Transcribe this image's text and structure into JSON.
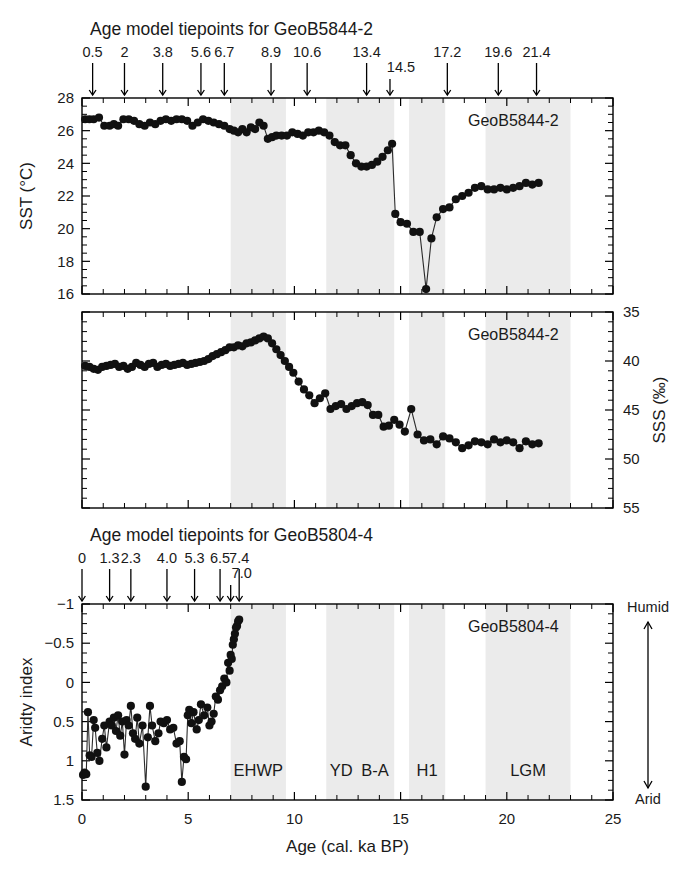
{
  "figure": {
    "xaxis": {
      "label": "Age (cal. ka BP)",
      "min": 0,
      "max": 25,
      "ticks": [
        0,
        5,
        10,
        15,
        20,
        25
      ],
      "tick_labels": [
        "0",
        "5",
        "10",
        "15",
        "20",
        "25"
      ],
      "minor_step": 1
    },
    "bands": [
      {
        "name": "EHWP",
        "start": 7.0,
        "end": 9.6,
        "label": "EHWP"
      },
      {
        "name": "YD",
        "start": 11.5,
        "end": 12.9,
        "label": "YD"
      },
      {
        "name": "B-A",
        "start": 12.9,
        "end": 14.7,
        "label": "B-A"
      },
      {
        "name": "H1",
        "start": 15.4,
        "end": 17.1,
        "label": "H1"
      },
      {
        "name": "LGM",
        "start": 19.0,
        "end": 23.0,
        "label": "LGM"
      }
    ],
    "humid_arrow": {
      "top_label": "Humid",
      "bottom_label": "Arid"
    }
  },
  "tiepoints_top": {
    "title": "Age model tiepoints for GeoB5844-2",
    "values": [
      "0.5",
      "2",
      "3.8",
      "5.6",
      "6.7",
      "8.9",
      "10.6",
      "13.4",
      "14.5",
      "17.2",
      "19.6",
      "21.4"
    ],
    "positions": [
      0.5,
      2.0,
      3.8,
      5.6,
      6.7,
      8.9,
      10.6,
      13.4,
      14.5,
      17.2,
      19.6,
      21.4
    ],
    "offset_label_index": 8
  },
  "tiepoints_bottom": {
    "title": "Age model tiepoints for GeoB5804-4",
    "values": [
      "0",
      "1.3",
      "2.3",
      "4.0",
      "5.3",
      "6.5",
      "7.0",
      "7.4"
    ],
    "positions": [
      0.0,
      1.3,
      2.3,
      4.0,
      5.3,
      6.5,
      7.0,
      7.4
    ],
    "offset_label_index": 6
  },
  "chart_data": [
    {
      "type": "line",
      "id": "sst",
      "core_label": "GeoB5844-2",
      "ylabel": "SST (°C)",
      "ylim": [
        16,
        28
      ],
      "y_inverted": false,
      "yticks": [
        16,
        18,
        20,
        22,
        24,
        26,
        28
      ],
      "ytick_labels": [
        "16",
        "18",
        "20",
        "22",
        "24",
        "26",
        "28"
      ],
      "yminor_step": 0.5,
      "xlabel": "",
      "x": [
        0.15,
        0.35,
        0.55,
        0.8,
        1.05,
        1.3,
        1.5,
        1.7,
        1.95,
        2.2,
        2.45,
        2.7,
        2.95,
        3.2,
        3.45,
        3.7,
        3.95,
        4.2,
        4.45,
        4.7,
        4.95,
        5.2,
        5.45,
        5.7,
        5.95,
        6.2,
        6.45,
        6.7,
        6.95,
        7.15,
        7.35,
        7.55,
        7.75,
        7.95,
        8.15,
        8.35,
        8.55,
        8.75,
        8.95,
        9.15,
        9.4,
        9.65,
        9.9,
        10.15,
        10.4,
        10.65,
        10.9,
        11.15,
        11.4,
        11.65,
        11.9,
        12.15,
        12.4,
        12.65,
        12.9,
        13.15,
        13.4,
        13.65,
        13.9,
        14.15,
        14.4,
        14.6,
        14.75,
        15.0,
        15.3,
        15.6,
        15.9,
        16.2,
        16.45,
        16.7,
        17.0,
        17.3,
        17.6,
        17.9,
        18.2,
        18.5,
        18.8,
        19.1,
        19.4,
        19.7,
        20.0,
        20.3,
        20.6,
        20.9,
        21.2,
        21.5
      ],
      "y": [
        26.7,
        26.7,
        26.7,
        26.8,
        26.3,
        26.3,
        26.4,
        26.3,
        26.7,
        26.7,
        26.6,
        26.4,
        26.3,
        26.5,
        26.4,
        26.6,
        26.7,
        26.6,
        26.7,
        26.7,
        26.6,
        26.3,
        26.5,
        26.7,
        26.6,
        26.5,
        26.4,
        26.3,
        26.1,
        26.0,
        25.9,
        26.1,
        25.9,
        26.2,
        26.1,
        26.5,
        26.3,
        25.5,
        25.6,
        25.7,
        25.7,
        25.7,
        25.9,
        25.8,
        25.7,
        25.9,
        25.9,
        26.0,
        25.9,
        25.7,
        25.3,
        25.1,
        25.1,
        24.5,
        24.0,
        23.8,
        23.8,
        23.9,
        24.1,
        24.4,
        24.8,
        25.2,
        20.9,
        20.4,
        20.3,
        19.8,
        19.8,
        16.3,
        19.4,
        20.7,
        21.2,
        21.3,
        21.8,
        22.0,
        22.2,
        22.5,
        22.6,
        22.4,
        22.4,
        22.5,
        22.4,
        22.5,
        22.6,
        22.8,
        22.7,
        22.8
      ]
    },
    {
      "type": "line",
      "id": "sss",
      "core_label": "GeoB5844-2",
      "ylabel": "SSS (‰)",
      "ylim": [
        35,
        55
      ],
      "y_inverted": true,
      "yticks": [
        35,
        40,
        45,
        50,
        55
      ],
      "ytick_labels": [
        "35",
        "40",
        "45",
        "50",
        "55"
      ],
      "yminor_step": 1,
      "xlabel": "",
      "x": [
        0.15,
        0.35,
        0.55,
        0.75,
        0.95,
        1.15,
        1.35,
        1.55,
        1.75,
        1.95,
        2.15,
        2.35,
        2.55,
        2.75,
        2.95,
        3.15,
        3.35,
        3.55,
        3.75,
        3.95,
        4.15,
        4.35,
        4.55,
        4.75,
        4.95,
        5.15,
        5.35,
        5.55,
        5.75,
        5.95,
        6.15,
        6.35,
        6.55,
        6.75,
        6.95,
        7.15,
        7.35,
        7.55,
        7.75,
        7.95,
        8.15,
        8.35,
        8.55,
        8.75,
        8.95,
        9.15,
        9.35,
        9.55,
        9.75,
        9.95,
        10.2,
        10.45,
        10.7,
        10.95,
        11.2,
        11.45,
        11.7,
        11.95,
        12.2,
        12.45,
        12.7,
        12.95,
        13.2,
        13.45,
        13.7,
        13.95,
        14.2,
        14.45,
        14.7,
        14.95,
        15.2,
        15.5,
        15.8,
        16.1,
        16.4,
        16.7,
        17.0,
        17.3,
        17.6,
        17.9,
        18.2,
        18.5,
        18.8,
        19.1,
        19.4,
        19.7,
        20.0,
        20.3,
        20.6,
        20.9,
        21.2,
        21.5
      ],
      "y": [
        40.5,
        40.6,
        40.8,
        40.9,
        40.6,
        40.5,
        40.4,
        40.3,
        40.6,
        40.5,
        40.8,
        40.6,
        40.2,
        40.4,
        40.6,
        40.3,
        40.2,
        40.6,
        40.4,
        40.3,
        40.5,
        40.4,
        40.3,
        40.2,
        40.4,
        40.3,
        40.2,
        40.1,
        40.0,
        39.8,
        39.5,
        39.3,
        39.1,
        38.9,
        38.6,
        38.6,
        38.4,
        38.5,
        38.2,
        38.1,
        37.9,
        37.7,
        37.5,
        37.7,
        38.2,
        38.8,
        39.4,
        40.0,
        40.6,
        41.2,
        42.1,
        42.9,
        43.5,
        44.3,
        43.8,
        43.3,
        44.9,
        44.6,
        44.4,
        44.9,
        44.6,
        44.3,
        44.2,
        44.5,
        45.5,
        45.5,
        46.7,
        46.6,
        46.0,
        46.5,
        47.2,
        44.9,
        47.5,
        48.1,
        48.0,
        48.5,
        47.7,
        47.9,
        48.3,
        48.9,
        48.6,
        48.2,
        48.3,
        48.5,
        48.0,
        48.3,
        48.1,
        48.3,
        48.9,
        48.2,
        48.5,
        48.4
      ]
    },
    {
      "type": "line",
      "id": "aridity",
      "core_label": "GeoB5804-4",
      "ylabel": "Aridty index",
      "ylim": [
        -1,
        1.5
      ],
      "y_inverted": true,
      "yticks": [
        -1,
        -0.5,
        0,
        0.5,
        1,
        1.5
      ],
      "ytick_labels": [
        "−1",
        "−0.5",
        "0",
        "0.5",
        "1",
        "1.5"
      ],
      "yminor_step": 0.125,
      "xlabel": "Age (cal. ka BP)",
      "x": [
        0.05,
        0.12,
        0.2,
        0.28,
        0.36,
        0.45,
        0.55,
        0.62,
        0.72,
        0.82,
        0.95,
        1.05,
        1.15,
        1.3,
        1.4,
        1.5,
        1.6,
        1.7,
        1.8,
        1.9,
        2.0,
        2.1,
        2.2,
        2.3,
        2.4,
        2.5,
        2.6,
        2.7,
        2.85,
        3.0,
        3.1,
        3.2,
        3.3,
        3.45,
        3.6,
        3.7,
        3.85,
        4.0,
        4.15,
        4.3,
        4.45,
        4.6,
        4.7,
        4.8,
        4.9,
        4.98,
        5.05,
        5.15,
        5.25,
        5.4,
        5.5,
        5.6,
        5.75,
        5.9,
        6.0,
        6.1,
        6.2,
        6.3,
        6.4,
        6.5,
        6.6,
        6.7,
        6.8,
        6.88,
        6.95,
        7.0,
        7.05,
        7.1,
        7.15,
        7.2,
        7.25,
        7.3,
        7.35,
        7.4
      ],
      "y": [
        1.18,
        1.15,
        1.17,
        0.38,
        0.93,
        0.95,
        0.48,
        0.58,
        0.9,
        1.0,
        0.72,
        0.55,
        0.83,
        0.5,
        0.55,
        0.45,
        0.62,
        0.42,
        0.68,
        0.5,
        0.92,
        0.48,
        0.55,
        0.3,
        0.65,
        0.72,
        0.45,
        0.78,
        0.55,
        1.33,
        0.7,
        0.3,
        0.55,
        0.75,
        0.65,
        0.5,
        0.52,
        0.48,
        0.6,
        0.58,
        0.78,
        0.75,
        1.27,
        0.95,
        0.98,
        0.42,
        0.35,
        0.52,
        0.38,
        0.6,
        0.48,
        0.28,
        0.42,
        0.32,
        0.55,
        0.5,
        0.4,
        0.18,
        0.22,
        0.1,
        0.05,
        -0.05,
        0.0,
        -0.25,
        -0.15,
        -0.35,
        -0.3,
        -0.48,
        -0.55,
        -0.62,
        -0.7,
        -0.72,
        -0.78,
        -0.8
      ]
    }
  ]
}
